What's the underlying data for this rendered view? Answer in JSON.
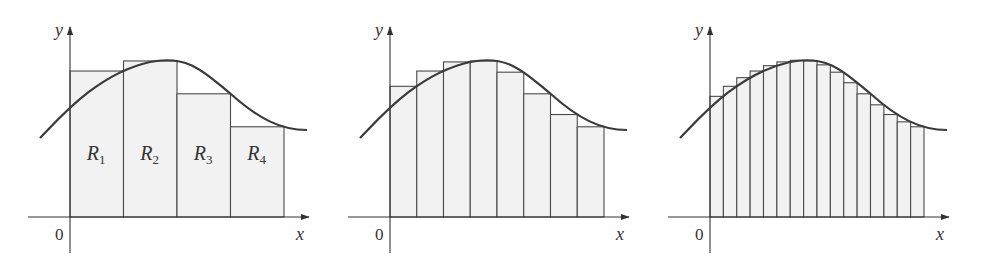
{
  "figure": {
    "panels": [
      {
        "n": 4,
        "offset": 0,
        "region_labels": [
          "R1",
          "R2",
          "R3",
          "R4"
        ]
      },
      {
        "n": 8,
        "offset": 320
      },
      {
        "n": 16,
        "offset": 640
      }
    ],
    "axis_labels": {
      "x": "x",
      "y": "y",
      "origin": "0"
    },
    "region_label_letter": "R",
    "region_subscripts": [
      "1",
      "2",
      "3",
      "4"
    ],
    "colors": {
      "fill": "#f2f2f2",
      "stroke": "#4a4a4a",
      "curve": "#3a3a3a"
    }
  },
  "chart_data": {
    "type": "area",
    "title": "",
    "panels": [
      {
        "n": 4,
        "labels": [
          "R1",
          "R2",
          "R3",
          "R4"
        ]
      },
      {
        "n": 8
      },
      {
        "n": 16
      }
    ],
    "xlabel": "x",
    "ylabel": "y",
    "origin_label": "0",
    "grid": false
  }
}
